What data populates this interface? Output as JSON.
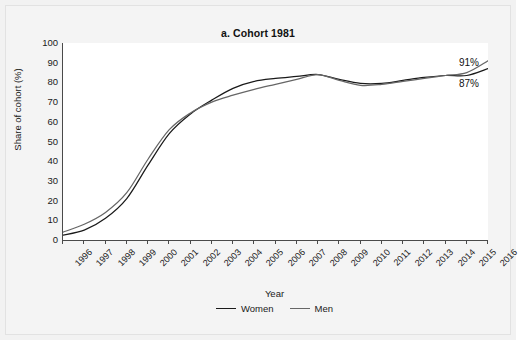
{
  "figure": {
    "background": "#f2f2f2",
    "plot_background": "#ffffff"
  },
  "chart_data": {
    "type": "line",
    "title": "a. Cohort 1981",
    "xlabel": "Year",
    "ylabel": "Share of cohort (%)",
    "xlim": [
      1996,
      2016
    ],
    "ylim": [
      0,
      100
    ],
    "yticks": [
      0,
      10,
      20,
      30,
      40,
      50,
      60,
      70,
      80,
      90,
      100
    ],
    "grid": false,
    "legend_position": "bottom-center",
    "x": [
      1996,
      1997,
      1998,
      1999,
      2000,
      2001,
      2002,
      2003,
      2004,
      2005,
      2006,
      2007,
      2008,
      2009,
      2010,
      2011,
      2012,
      2013,
      2014,
      2015,
      2016
    ],
    "series": [
      {
        "name": "Women",
        "color": "#1a1a1a",
        "values": [
          2.5,
          5,
          11,
          21,
          38,
          54,
          64,
          71,
          77,
          80.5,
          82,
          83,
          84,
          81.5,
          79.5,
          79.5,
          81,
          82.5,
          83.5,
          83.5,
          87
        ],
        "end_label": "87%"
      },
      {
        "name": "Men",
        "color": "#666666",
        "values": [
          4,
          8,
          14,
          24,
          41,
          56,
          64.5,
          70,
          73.5,
          76.5,
          79,
          81.5,
          84,
          81,
          78.5,
          79,
          80.5,
          82,
          83.5,
          85,
          91
        ],
        "end_label": "91%"
      }
    ],
    "xtick_labels": [
      "1996",
      "1997",
      "1998",
      "1999",
      "2000",
      "2001",
      "2002",
      "2003",
      "2004",
      "2005",
      "2006",
      "2007",
      "2008",
      "2009",
      "2010",
      "2011",
      "2012",
      "2013",
      "2014",
      "2015",
      "2016"
    ],
    "annotations": [
      {
        "text": "91%",
        "series": "Men",
        "at_x": 2016
      },
      {
        "text": "87%",
        "series": "Women",
        "at_x": 2016
      }
    ]
  },
  "legend": {
    "items": [
      {
        "label": "Women",
        "color": "#1a1a1a"
      },
      {
        "label": "Men",
        "color": "#666666"
      }
    ]
  }
}
